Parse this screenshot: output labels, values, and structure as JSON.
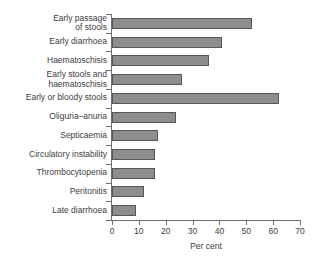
{
  "chart_data": {
    "type": "bar",
    "orientation": "horizontal",
    "title": "",
    "xlabel": "Per cent",
    "ylabel": "",
    "xlim": [
      0,
      70
    ],
    "xticks": [
      0,
      10,
      20,
      30,
      40,
      50,
      60,
      70
    ],
    "xtick_labels": [
      "0",
      "10",
      "20",
      "30",
      "40",
      "50",
      "60",
      "70"
    ],
    "grid": false,
    "legend": null,
    "bar_color": "#8d8d8d",
    "bar_edge_color": "#575757",
    "axis_color": "#6e6e6e",
    "categories": [
      "Early passage of stools",
      "Early diarrhoea",
      "Haematoschisis",
      "Early stools and haematoschisis",
      "Early or bloody stools",
      "Oliguria–anuria",
      "Septicaemia",
      "Circulatory instability",
      "Thrombocytopenia",
      "Peritonitis",
      "Late diarrhoea"
    ],
    "category_labels_wrapped": [
      [
        "Early passage",
        "of stools"
      ],
      [
        "Early diarrhoea"
      ],
      [
        "Haematoschisis"
      ],
      [
        "Early stools and",
        "haematoschisis"
      ],
      [
        "Early or bloody stools"
      ],
      [
        "Oliguria–anuria"
      ],
      [
        "Septicaemia"
      ],
      [
        "Circulatory instability"
      ],
      [
        "Thrombocytopenia"
      ],
      [
        "Peritonitis"
      ],
      [
        "Late diarrhoea"
      ]
    ],
    "values": [
      52,
      41,
      36,
      26,
      62,
      24,
      17,
      16,
      16,
      12,
      9
    ]
  }
}
